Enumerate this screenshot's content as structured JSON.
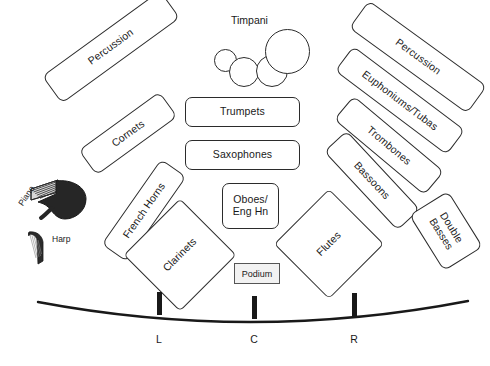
{
  "diagram": {
    "stroke_color": "#2b2b2b",
    "fill_color": "#ffffff",
    "piano_color": "#262626",
    "podium_fill": "#f2f2f2"
  },
  "sections": [
    {
      "id": "percussion-left",
      "label": "Percussion",
      "x": 38,
      "y": 30,
      "w": 146,
      "h": 34,
      "rotate": -36
    },
    {
      "id": "cornets",
      "label": "Cornets",
      "x": 78,
      "y": 118,
      "w": 100,
      "h": 31,
      "rotate": -36
    },
    {
      "id": "french-horns",
      "label": "French Horns",
      "x": 92,
      "y": 195,
      "w": 104,
      "h": 31,
      "rotate": -55
    },
    {
      "id": "clarinets",
      "label": "Clarinets",
      "x": 140,
      "y": 215,
      "w": 80,
      "h": 80,
      "rotate": -45
    },
    {
      "id": "trumpets",
      "label": "Trumpets",
      "x": 185,
      "y": 97,
      "w": 115,
      "h": 30,
      "rotate": 0
    },
    {
      "id": "saxophones",
      "label": "Saxophones",
      "x": 185,
      "y": 140,
      "w": 115,
      "h": 30,
      "rotate": 0
    },
    {
      "id": "oboes-english-horn",
      "label": "Oboes/\nEng Hn",
      "x": 222,
      "y": 183,
      "w": 57,
      "h": 46,
      "rotate": 0
    },
    {
      "id": "flutes",
      "label": "Flutes",
      "x": 290,
      "y": 205,
      "w": 78,
      "h": 78,
      "rotate": -45
    },
    {
      "id": "bassoons",
      "label": "Bassoons",
      "x": 318,
      "y": 165,
      "w": 108,
      "h": 31,
      "rotate": 47
    },
    {
      "id": "trombones",
      "label": "Trombones",
      "x": 330,
      "y": 130,
      "w": 118,
      "h": 31,
      "rotate": 40
    },
    {
      "id": "euphoniums-tubas",
      "label": "Euphoniums/Tubas",
      "x": 330,
      "y": 85,
      "w": 140,
      "h": 31,
      "rotate": 37
    },
    {
      "id": "percussion-right",
      "label": "Percussion",
      "x": 345,
      "y": 40,
      "w": 146,
      "h": 34,
      "rotate": 36
    },
    {
      "id": "double-basses",
      "label": "Double\nBasses",
      "x": 413,
      "y": 208,
      "w": 66,
      "h": 46,
      "rotate": 58
    }
  ],
  "timpani": {
    "label": "Timpani",
    "label_x": 231,
    "label_y": 14,
    "drums": [
      {
        "id": "timpani-drum-1",
        "x": 214,
        "y": 49,
        "d": 23
      },
      {
        "id": "timpani-drum-2",
        "x": 229,
        "y": 57,
        "d": 30
      },
      {
        "id": "timpani-drum-3",
        "x": 256,
        "y": 55,
        "d": 32
      },
      {
        "id": "timpani-drum-4",
        "x": 265,
        "y": 29,
        "d": 45
      }
    ]
  },
  "piano": {
    "label": "Piano",
    "label_x": 16,
    "label_y": 202,
    "label_rotate": -56,
    "x": 28,
    "y": 178,
    "w": 62,
    "h": 50
  },
  "harp": {
    "label": "Harp",
    "label_x": 52,
    "label_y": 234,
    "x": 26,
    "y": 228,
    "w": 22,
    "h": 38
  },
  "podium": {
    "label": "Podium",
    "x": 234,
    "y": 263,
    "w": 46,
    "h": 21
  },
  "stage_edge": {
    "start_x": 38,
    "start_y": 302,
    "end_x": 468,
    "end_y": 301,
    "mid_x": 253,
    "mid_y": 322,
    "markers": [
      {
        "id": "marker-left",
        "label": "L",
        "x": 157,
        "y": 292
      },
      {
        "id": "marker-center",
        "label": "C",
        "x": 252,
        "y": 296
      },
      {
        "id": "marker-right",
        "label": "R",
        "x": 352,
        "y": 293
      }
    ],
    "marker_text_y": 333
  }
}
